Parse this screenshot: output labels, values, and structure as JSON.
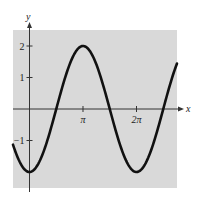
{
  "chart_data": {
    "type": "line",
    "title": "",
    "function": "y = -2cos(x)",
    "xlabel": "x",
    "ylabel": "y",
    "xlim": [
      -0.97,
      8.66
    ],
    "ylim": [
      -2.5,
      2.5
    ],
    "x_ticks": [
      {
        "value": 3.14159,
        "label": "π"
      },
      {
        "value": 6.28319,
        "label": "2π"
      }
    ],
    "y_ticks": [
      {
        "value": 2,
        "label": "2"
      },
      {
        "value": 1,
        "label": "1"
      },
      {
        "value": -1,
        "label": "−1"
      }
    ],
    "series": [
      {
        "name": "y = -2cos(x)",
        "x": [
          -0.97,
          0,
          1.5708,
          3.14159,
          4.71239,
          6.28319,
          7.85398,
          8.66
        ],
        "values": [
          -1.13,
          -2,
          0,
          2,
          0,
          -2,
          0,
          1.4
        ]
      }
    ],
    "grid": false,
    "legend": "none",
    "colors": {
      "background": "#d9d9d9",
      "curve": "#111111",
      "axes": "#333333"
    }
  }
}
